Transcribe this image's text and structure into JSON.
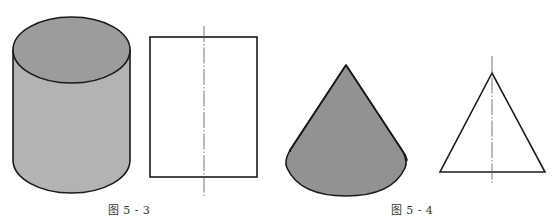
{
  "figures": [
    {
      "id": "fig-5-3",
      "caption": "图 5 - 3",
      "caption_center_x": 129,
      "solid": "cylinder",
      "projection": "rectangle-with-centerline"
    },
    {
      "id": "fig-5-4",
      "caption": "图 5 - 4",
      "caption_center_x": 412,
      "solid": "cone",
      "projection": "triangle-with-centerline"
    }
  ],
  "colors": {
    "background": "#ffffff",
    "outline": "#1a1a1a",
    "cylinder_top": "#9c9c9c",
    "cylinder_body": "#b3b3b3",
    "cone_fill": "#929292",
    "centerline": "#555555",
    "caption_text": "#333333"
  }
}
